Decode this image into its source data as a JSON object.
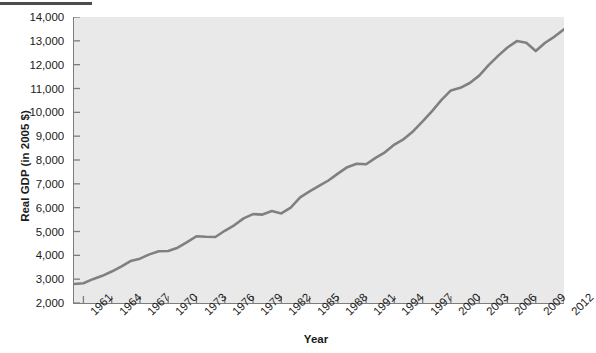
{
  "figure": {
    "name": "real-gdp-line-chart",
    "background_color": "#ffffff",
    "plot_background_color": "#e9e9e9",
    "axis_color": "#7d7d7d",
    "line_color": "#808080"
  },
  "chart_data": {
    "type": "line",
    "title": "",
    "subtitle": "",
    "xlabel": "Year",
    "ylabel": "Real GDP (in 2005 $)",
    "xlim": [
      1960,
      2012
    ],
    "ylim": [
      2000,
      14000
    ],
    "ytick_step": 1000,
    "xtick_step": 3,
    "grid": false,
    "legend": null,
    "legend_position": "none",
    "ytick_labels": [
      "14,000",
      "13,000",
      "12,000",
      "11,000",
      "10,000",
      "9,000",
      "8,000",
      "7,000",
      "6,000",
      "5,000",
      "4,000",
      "3,000",
      "2,000"
    ],
    "ytick_values": [
      14000,
      13000,
      12000,
      11000,
      10000,
      9000,
      8000,
      7000,
      6000,
      5000,
      4000,
      3000,
      2000
    ],
    "xtick_labels": [
      "1961",
      "1964",
      "1967",
      "1970",
      "1973",
      "1976",
      "1979",
      "1982",
      "1985",
      "1988",
      "1991",
      "1994",
      "1997",
      "2000",
      "2003",
      "2006",
      "2009",
      "2012"
    ],
    "xtick_values": [
      1961,
      1964,
      1967,
      1970,
      1973,
      1976,
      1979,
      1982,
      1985,
      1988,
      1991,
      1994,
      1997,
      2000,
      2003,
      2006,
      2009,
      2012
    ],
    "series": [
      {
        "name": "Real GDP",
        "color": "#808080",
        "x": [
          1960,
          1961,
          1962,
          1963,
          1964,
          1965,
          1966,
          1967,
          1968,
          1969,
          1970,
          1971,
          1972,
          1973,
          1974,
          1975,
          1976,
          1977,
          1978,
          1979,
          1980,
          1981,
          1982,
          1983,
          1984,
          1985,
          1986,
          1987,
          1988,
          1989,
          1990,
          1991,
          1992,
          1993,
          1994,
          1995,
          1996,
          1997,
          1998,
          1999,
          2000,
          2001,
          2002,
          2003,
          2004,
          2005,
          2006,
          2007,
          2008,
          2009,
          2010,
          2011,
          2012
        ],
        "values": [
          2800,
          2830,
          3000,
          3140,
          3320,
          3530,
          3760,
          3860,
          4040,
          4170,
          4180,
          4320,
          4550,
          4800,
          4780,
          4770,
          5030,
          5260,
          5550,
          5730,
          5710,
          5860,
          5760,
          6000,
          6430,
          6680,
          6910,
          7140,
          7430,
          7700,
          7840,
          7820,
          8090,
          8320,
          8650,
          8880,
          9210,
          9620,
          10050,
          10520,
          10920,
          11030,
          11230,
          11540,
          11980,
          12370,
          12720,
          12990,
          12920,
          12570,
          12920,
          13180,
          13480
        ]
      }
    ]
  },
  "axes": {
    "y_title": "Real GDP (in 2005 $)",
    "x_title": "Year"
  }
}
